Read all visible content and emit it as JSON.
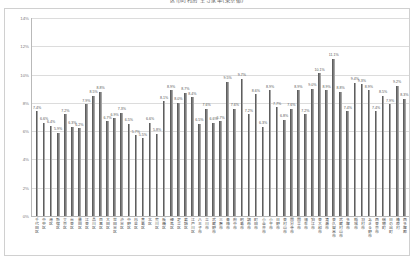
{
  "chart_data": {
    "type": "bar",
    "title": "区市町村別 空き家率(東京都)",
    "xlabel": "",
    "ylabel": "",
    "ylim": [
      0,
      14
    ],
    "yticks": [
      "0%",
      "2%",
      "4%",
      "6%",
      "8%",
      "10%",
      "12%",
      "14%"
    ],
    "ytick_values": [
      0,
      2,
      4,
      6,
      8,
      10,
      12,
      14
    ],
    "grid": true,
    "legend": "none",
    "bar_color": "#7d7d7d",
    "value_suffix": "%",
    "categories": [
      "千代田区",
      "中央区",
      "港区",
      "新宿区",
      "文京区",
      "台東区",
      "墨田区",
      "江東区",
      "品川区",
      "目黒区",
      "大田区",
      "世田谷区",
      "渋谷区",
      "中野区",
      "杉並区",
      "豊島区",
      "北区",
      "荒川区",
      "板橋区",
      "練馬区",
      "足立区",
      "葛飾区",
      "江戸川区",
      "八王子市",
      "立川市",
      "武蔵野市",
      "三鷹市",
      "青梅市",
      "府中市",
      "昭島市",
      "調布市",
      "町田市",
      "小金井市",
      "小平市",
      "日野市",
      "東村山市",
      "国分寺市",
      "国立市",
      "福生市",
      "狛江市",
      "東大和市",
      "清瀬市",
      "東久留米市",
      "武蔵村山市",
      "多摩市",
      "稲城市",
      "羽村市",
      "あきる野市",
      "西東京市",
      "瑞穂町",
      "日の出町",
      "檜原村",
      "西多摩郡"
    ],
    "values": [
      7.4,
      6.6,
      6.4,
      5.9,
      7.2,
      6.3,
      6.2,
      7.9,
      8.5,
      8.8,
      6.7,
      6.9,
      7.3,
      6.5,
      5.7,
      5.5,
      6.6,
      5.8,
      8.1,
      8.9,
      8.0,
      8.7,
      8.4,
      6.5,
      7.6,
      6.6,
      6.7,
      9.5,
      7.6,
      9.7,
      7.2,
      8.6,
      6.3,
      8.9,
      7.7,
      6.8,
      7.6,
      8.9,
      7.2,
      9.0,
      10.1,
      8.9,
      11.1,
      8.8,
      7.4,
      9.4,
      9.3,
      8.9,
      7.4,
      8.5,
      7.9,
      9.2,
      8.3
    ],
    "series": [
      {
        "name": "空き家率",
        "values": [
          7.4,
          6.6,
          6.4,
          5.9,
          7.2,
          6.3,
          6.2,
          7.9,
          8.5,
          8.8,
          6.7,
          6.9,
          7.3,
          6.5,
          5.7,
          5.5,
          6.6,
          5.8,
          8.1,
          8.9,
          8.0,
          8.7,
          8.4,
          6.5,
          7.6,
          6.6,
          6.7,
          9.5,
          7.6,
          9.7,
          7.2,
          8.6,
          6.3,
          8.9,
          7.7,
          6.8,
          7.6,
          8.9,
          7.2,
          9.0,
          10.1,
          8.9,
          11.1,
          8.8,
          7.4,
          9.4,
          9.3,
          8.9,
          7.4,
          8.5,
          7.9,
          9.2,
          8.3
        ]
      }
    ]
  }
}
